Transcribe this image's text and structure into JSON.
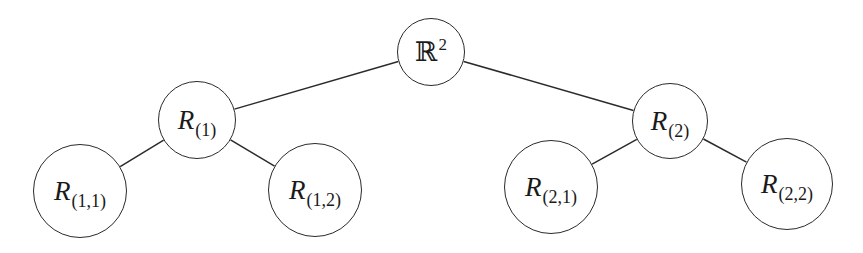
{
  "diagram": {
    "type": "binary-tree",
    "edge_color": "#2a2a2a",
    "node_border_color": "#2a2a2a",
    "background": "#ffffff",
    "nodes": {
      "root": {
        "id": "root",
        "main": "ℝ",
        "sup": "2",
        "sub": "",
        "cx": 431,
        "cy": 52,
        "r": 34
      },
      "n1": {
        "id": "n1",
        "main": "R",
        "sub": "(1)",
        "sup": "",
        "cx": 197,
        "cy": 120,
        "r": 39
      },
      "n2": {
        "id": "n2",
        "main": "R",
        "sub": "(2)",
        "sup": "",
        "cx": 670,
        "cy": 121,
        "r": 38
      },
      "n11": {
        "id": "n11",
        "main": "R",
        "sub": "(1,1)",
        "sup": "",
        "cx": 80,
        "cy": 191,
        "r": 47
      },
      "n12": {
        "id": "n12",
        "main": "R",
        "sub": "(1,2)",
        "sup": "",
        "cx": 315,
        "cy": 190,
        "r": 47
      },
      "n21": {
        "id": "n21",
        "main": "R",
        "sub": "(2,1)",
        "sup": "",
        "cx": 551,
        "cy": 187,
        "r": 47
      },
      "n22": {
        "id": "n22",
        "main": "R",
        "sub": "(2,2)",
        "sup": "",
        "cx": 787,
        "cy": 184,
        "r": 46
      }
    },
    "edges": [
      {
        "from": "root",
        "to": "n1"
      },
      {
        "from": "root",
        "to": "n2"
      },
      {
        "from": "n1",
        "to": "n11"
      },
      {
        "from": "n1",
        "to": "n12"
      },
      {
        "from": "n2",
        "to": "n21"
      },
      {
        "from": "n2",
        "to": "n22"
      }
    ]
  }
}
